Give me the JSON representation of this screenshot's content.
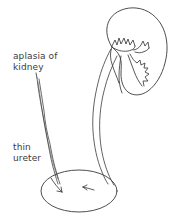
{
  "figure": {
    "background_color": "#ffffff",
    "stroke_color": "#3a3a3a",
    "text_color": "#3b3b3b"
  },
  "labels": {
    "aplasia_of_kidney": "aplasia of\nkidney",
    "thin_ureter": "thin\nureter"
  },
  "structures": {
    "normal_kidney": "kidney",
    "renal_calyces": "calyces",
    "renal_pelvis": "renal pelvis",
    "normal_ureter": "ureter",
    "thin_ureter": "thin ureter",
    "bladder": "bladder",
    "left_ureteral_orifice": "ureteral orifice",
    "right_ureteral_orifice": "ureteral orifice"
  }
}
